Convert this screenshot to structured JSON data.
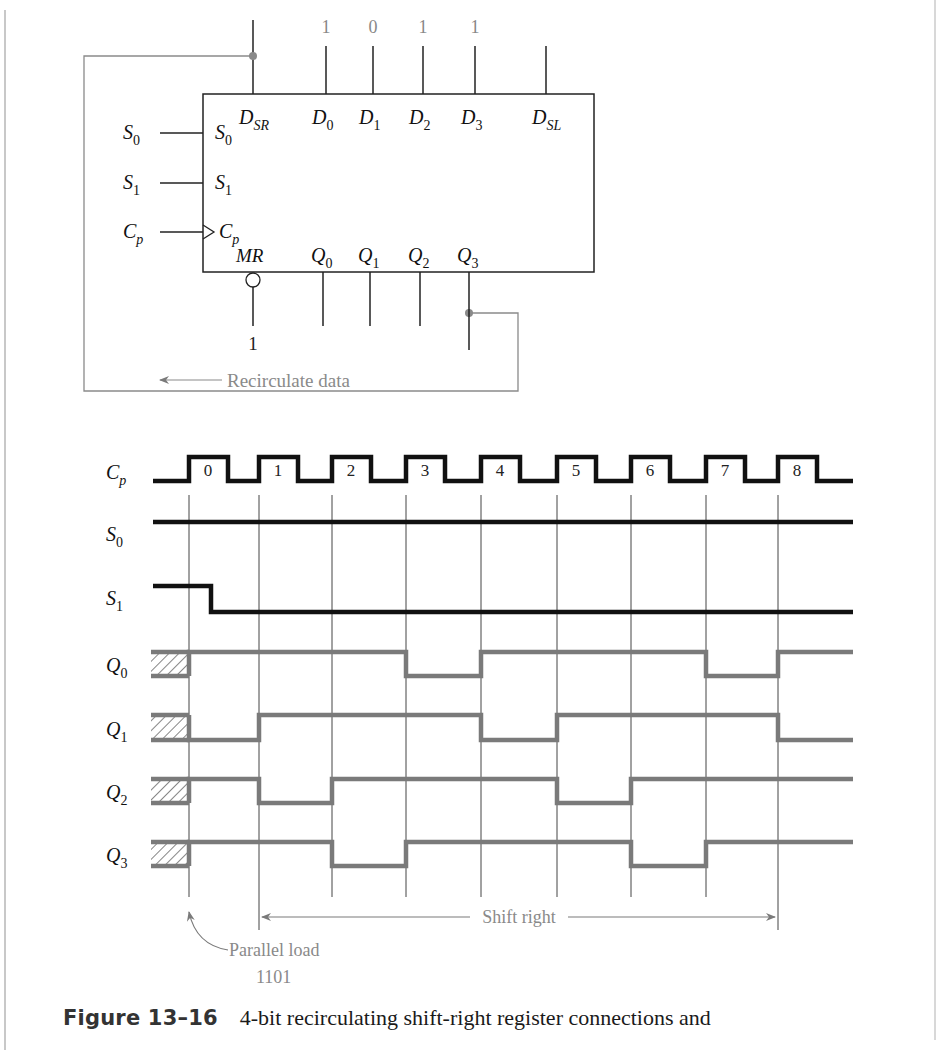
{
  "schematic": {
    "block": {
      "left": 203,
      "top": 94,
      "right": 594,
      "bottom": 272
    },
    "top_pins": [
      {
        "id": "DSR",
        "main": "D",
        "sub": "SR",
        "x": 253,
        "value": ""
      },
      {
        "id": "D0",
        "main": "D",
        "sub": "0",
        "x": 326,
        "value": "1"
      },
      {
        "id": "D1",
        "main": "D",
        "sub": "1",
        "x": 373,
        "value": "0"
      },
      {
        "id": "D2",
        "main": "D",
        "sub": "2",
        "x": 423,
        "value": "1"
      },
      {
        "id": "D3",
        "main": "D",
        "sub": "3",
        "x": 475,
        "value": "1"
      },
      {
        "id": "DSL",
        "main": "D",
        "sub": "SL",
        "x": 546,
        "value": ""
      }
    ],
    "left_pins": [
      {
        "id": "S0",
        "main": "S",
        "sub": "0",
        "y": 133,
        "clock": false
      },
      {
        "id": "S1",
        "main": "S",
        "sub": "1",
        "y": 183,
        "clock": false
      },
      {
        "id": "Cp",
        "main": "C",
        "sub": "p",
        "y": 232,
        "clock": true
      }
    ],
    "bottom_pins": [
      {
        "id": "MR",
        "main": "MR",
        "sub": "",
        "x": 253,
        "inverted": true,
        "value": "1"
      },
      {
        "id": "Q0",
        "main": "Q",
        "sub": "0",
        "x": 323
      },
      {
        "id": "Q1",
        "main": "Q",
        "sub": "1",
        "x": 370
      },
      {
        "id": "Q2",
        "main": "Q",
        "sub": "2",
        "x": 420
      },
      {
        "id": "Q3",
        "main": "Q",
        "sub": "3",
        "x": 469
      }
    ],
    "recirculate_label": "Recirculate data",
    "wire_color": "#8a8a8a"
  },
  "timing": {
    "clock_edges_x": [
      189,
      259,
      332,
      406,
      481,
      557,
      631,
      706,
      778
    ],
    "clock_labels": [
      "0",
      "1",
      "2",
      "3",
      "4",
      "5",
      "6",
      "7",
      "8"
    ],
    "x_start": 153,
    "x_end": 853,
    "signals": [
      {
        "name": "C",
        "sub": "p",
        "type": "clock",
        "y_low": 481,
        "y_high": 457,
        "color": "#111111"
      },
      {
        "name": "S",
        "sub": "0",
        "type": "level",
        "y_low": 522,
        "y_high": 522,
        "color": "#111111"
      },
      {
        "name": "S",
        "sub": "1",
        "type": "level",
        "y_high": 586,
        "y_low": 612,
        "color": "#111111"
      },
      {
        "name": "Q",
        "sub": "0",
        "type": "data",
        "y_high": 652,
        "y_low": 676,
        "bits": [
          1,
          1,
          1,
          0,
          1,
          1,
          1,
          0,
          1
        ],
        "color": "#7a7a7a"
      },
      {
        "name": "Q",
        "sub": "1",
        "type": "data",
        "y_high": 715,
        "y_low": 740,
        "bits": [
          0,
          1,
          1,
          1,
          0,
          1,
          1,
          1,
          0
        ],
        "color": "#7a7a7a"
      },
      {
        "name": "Q",
        "sub": "2",
        "type": "data",
        "y_high": 779,
        "y_low": 803,
        "bits": [
          1,
          0,
          1,
          1,
          1,
          0,
          1,
          1,
          1
        ],
        "color": "#7a7a7a"
      },
      {
        "name": "Q",
        "sub": "3",
        "type": "data",
        "y_high": 842,
        "y_low": 866,
        "bits": [
          1,
          1,
          0,
          1,
          1,
          1,
          0,
          1,
          1
        ],
        "color": "#7a7a7a"
      }
    ],
    "annotations": {
      "shift_right": "Shift right",
      "parallel_load": "Parallel load",
      "parallel_value": "1101"
    }
  },
  "caption": {
    "label": "Figure 13–16",
    "text": "4-bit recirculating shift-right register connections and"
  }
}
